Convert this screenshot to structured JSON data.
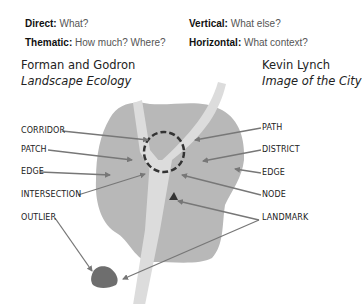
{
  "questions": {
    "left": [
      {
        "term": "Direct:",
        "text": "What?"
      },
      {
        "term": "Thematic:",
        "text": "How much? Where?"
      }
    ],
    "right": [
      {
        "term": "Vertical:",
        "text": "What else?"
      },
      {
        "term": "Horizontal:",
        "text": "What context?"
      }
    ]
  },
  "sources": {
    "left": {
      "author": "Forman and Godron",
      "work": "Landscape Ecology"
    },
    "right": {
      "author": "Kevin Lynch",
      "work": "Image of the City"
    }
  },
  "labels_left": [
    "CORRIDOR",
    "PATCH",
    "EDGE",
    "INTERSECTION",
    "OUTLIER"
  ],
  "labels_right": [
    "PATH",
    "DISTRICT",
    "EDGE",
    "NODE",
    "LANDMARK"
  ],
  "colors": {
    "region": "#b8b8b8",
    "corridor": "#dcdcdc",
    "outlier": "#6e6e6e",
    "landmark": "#333333",
    "arrow": "#777777",
    "circle": "#333333"
  }
}
